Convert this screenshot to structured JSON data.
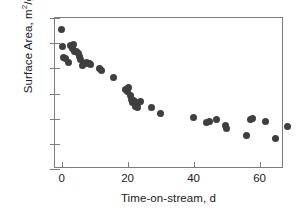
{
  "chart_data": {
    "type": "scatter",
    "title": "",
    "xlabel": "Time-on-stream, d",
    "ylabel": "Surface Area, m2/g",
    "ylabel_parts": {
      "pre": "Surface Area, m",
      "sup": "2",
      "post": "/g"
    },
    "xlim": [
      -2,
      67.4
    ],
    "ylim": [
      16,
      28
    ],
    "xticks": [
      0,
      20,
      40,
      60
    ],
    "yticks": [
      16,
      18,
      20,
      22,
      24,
      26,
      28
    ],
    "grid": false,
    "legend": null,
    "marker": {
      "shape": "circle",
      "color": "#3f3f3f",
      "size_px": 7
    },
    "series": [
      {
        "name": "Surface Area",
        "points": [
          [
            0.0,
            27.05
          ],
          [
            0.4,
            25.75
          ],
          [
            0.5,
            24.85
          ],
          [
            1.1,
            24.8
          ],
          [
            2.0,
            24.45
          ],
          [
            2.6,
            25.85
          ],
          [
            3.2,
            25.55
          ],
          [
            3.6,
            25.9
          ],
          [
            4.0,
            25.35
          ],
          [
            4.4,
            25.3
          ],
          [
            5.0,
            25.15
          ],
          [
            5.4,
            24.95
          ],
          [
            5.8,
            24.7
          ],
          [
            6.2,
            24.25
          ],
          [
            6.6,
            24.35
          ],
          [
            7.4,
            24.45
          ],
          [
            8.0,
            24.4
          ],
          [
            8.4,
            24.35
          ],
          [
            8.8,
            24.3
          ],
          [
            11.6,
            23.95
          ],
          [
            12.2,
            23.85
          ],
          [
            15.8,
            23.25
          ],
          [
            19.5,
            22.35
          ],
          [
            19.9,
            22.15
          ],
          [
            20.4,
            22.45
          ],
          [
            20.8,
            21.85
          ],
          [
            21.2,
            21.55
          ],
          [
            21.5,
            21.3
          ],
          [
            21.8,
            21.45
          ],
          [
            22.2,
            21.4
          ],
          [
            22.5,
            20.95
          ],
          [
            22.9,
            20.85
          ],
          [
            23.4,
            21.25
          ],
          [
            23.8,
            21.35
          ],
          [
            27.2,
            20.9
          ],
          [
            30.0,
            20.45
          ],
          [
            40.1,
            20.1
          ],
          [
            43.9,
            19.7
          ],
          [
            44.8,
            19.75
          ],
          [
            47.0,
            19.95
          ],
          [
            49.6,
            19.45
          ],
          [
            49.9,
            19.2
          ],
          [
            56.1,
            18.7
          ],
          [
            57.2,
            19.95
          ],
          [
            57.9,
            20.0
          ],
          [
            61.9,
            19.75
          ],
          [
            64.7,
            18.45
          ],
          [
            68.5,
            19.35
          ]
        ]
      }
    ]
  }
}
